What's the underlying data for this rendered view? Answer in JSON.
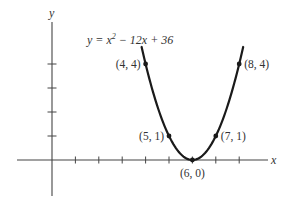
{
  "chart_data": {
    "type": "line",
    "equation": {
      "prefix": "y = x",
      "exponent": "2",
      "suffix": " − 12x + 36"
    },
    "xlabel": "x",
    "ylabel": "y",
    "x_ticks": [
      1,
      2,
      3,
      4,
      5,
      6,
      7,
      8
    ],
    "y_ticks": [
      1,
      2,
      3,
      4
    ],
    "tick_labels_shown": false,
    "xlim": [
      -1.5,
      9.2
    ],
    "ylim": [
      -1.5,
      5.8
    ],
    "grid": false,
    "series": [
      {
        "name": "y = x^2 - 12x + 36",
        "curve_x_range": [
          3.83,
          8.17
        ],
        "color": "#1a1a1a"
      }
    ],
    "points": [
      {
        "x": 4,
        "y": 4,
        "label": "(4, 4)",
        "label_side": "left"
      },
      {
        "x": 5,
        "y": 1,
        "label": "(5, 1)",
        "label_side": "left"
      },
      {
        "x": 6,
        "y": 0,
        "label": "(6, 0)",
        "label_side": "below"
      },
      {
        "x": 7,
        "y": 1,
        "label": "(7, 1)",
        "label_side": "right"
      },
      {
        "x": 8,
        "y": 4,
        "label": "(8, 4)",
        "label_side": "right"
      }
    ]
  },
  "colors": {
    "axis": "#444444",
    "curve": "#1a1a1a",
    "text": "#333333"
  }
}
